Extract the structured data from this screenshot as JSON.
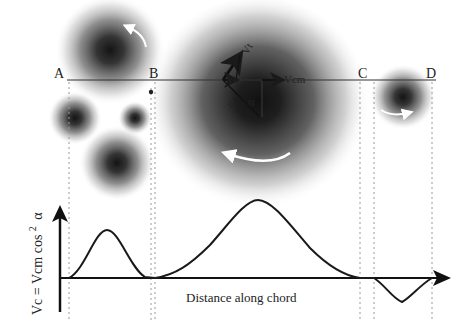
{
  "points": {
    "A": "A",
    "B": "B",
    "C": "C",
    "D": "D"
  },
  "vectors": {
    "vt": "Vt",
    "vc": "Vc",
    "vcm": "Vcm",
    "r": "r",
    "alpha": "α"
  },
  "graph": {
    "ylabel_prefix": "Vc = Vcm cos",
    "ylabel_exponent": "2",
    "ylabel_suffix": "α",
    "xlabel": "Distance along chord"
  },
  "colors": {
    "vortex_dark": "#1a1a1a",
    "line": "#222222",
    "dashed": "#999999",
    "rotation_arrow": "#ffffff"
  },
  "vortices": [
    {
      "name": "top-left-vortex",
      "cx": 110,
      "cy": 50,
      "r": 55,
      "rotation": "counter-clockwise"
    },
    {
      "name": "left-vortex",
      "cx": 75,
      "cy": 118,
      "r": 27
    },
    {
      "name": "small-vortex",
      "cx": 135,
      "cy": 118,
      "r": 17
    },
    {
      "name": "lower-left-vortex",
      "cx": 117,
      "cy": 163,
      "r": 37
    },
    {
      "name": "large-central-vortex",
      "cx": 258,
      "cy": 105,
      "r": 112,
      "rotation": "counter-clockwise"
    },
    {
      "name": "right-vortex",
      "cx": 403,
      "cy": 97,
      "r": 32,
      "rotation": "clockwise"
    }
  ]
}
